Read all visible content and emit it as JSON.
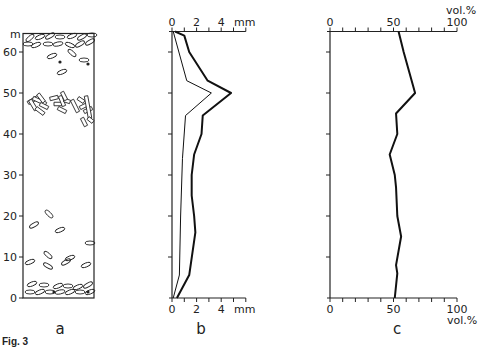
{
  "figure_label": "Fig. 3",
  "depth_axis": {
    "unit": "m",
    "ticks": [
      0,
      10,
      20,
      30,
      40,
      50,
      60
    ],
    "range": [
      0,
      65
    ]
  },
  "chart_data": [
    {
      "panel": "a",
      "type": "diagram",
      "title": "a",
      "description": "Stratigraphic column showing clast shapes with depth",
      "ylabel": "m",
      "yticks": [
        0,
        10,
        20,
        30,
        40,
        50,
        60
      ],
      "ylim": [
        0,
        65
      ],
      "features": [
        {
          "name": "dense elongated clasts",
          "depth_range": [
            56,
            65
          ]
        },
        {
          "name": "scattered clasts",
          "depth_range": [
            52,
            57
          ]
        },
        {
          "name": "angular crystal/fragment cluster",
          "depth_range": [
            43,
            50
          ]
        },
        {
          "name": "single clast",
          "depth_range": [
            19,
            21
          ]
        },
        {
          "name": "scattered clasts",
          "depth_range": [
            5,
            11
          ]
        },
        {
          "name": "dense clasts at base",
          "depth_range": [
            0,
            3
          ]
        }
      ]
    },
    {
      "panel": "b",
      "type": "line",
      "title": "b",
      "xlabel": "mm",
      "ylabel": "m",
      "xticks": [
        0,
        2,
        4
      ],
      "xlim": [
        0,
        6
      ],
      "ylim": [
        0,
        65
      ],
      "series": [
        {
          "name": "thick line",
          "points": [
            [
              0.25,
              65
            ],
            [
              1.0,
              64
            ],
            [
              1.4,
              60
            ],
            [
              2.9,
              53
            ],
            [
              4.8,
              50
            ],
            [
              2.5,
              44.5
            ],
            [
              2.4,
              40
            ],
            [
              1.8,
              35
            ],
            [
              1.6,
              30
            ],
            [
              1.6,
              25
            ],
            [
              1.8,
              20
            ],
            [
              1.9,
              16
            ],
            [
              1.4,
              5.6
            ],
            [
              0.4,
              0
            ]
          ]
        },
        {
          "name": "thin line",
          "points": [
            [
              0.1,
              65
            ],
            [
              1.2,
              53
            ],
            [
              3.2,
              50
            ],
            [
              1.1,
              44.5
            ],
            [
              0.85,
              34
            ],
            [
              0.7,
              20
            ],
            [
              0.6,
              5.6
            ],
            [
              0.1,
              0
            ]
          ]
        }
      ]
    },
    {
      "panel": "c",
      "type": "line",
      "title": "c",
      "xlabel": "vol.%",
      "ylabel": "m",
      "xticks": [
        0,
        50,
        100
      ],
      "xlim": [
        0,
        100
      ],
      "ylim": [
        0,
        65
      ],
      "series": [
        {
          "name": "volume percent",
          "points": [
            [
              54,
              65
            ],
            [
              58,
              60
            ],
            [
              67,
              50
            ],
            [
              52,
              45
            ],
            [
              53,
              40
            ],
            [
              47,
              35
            ],
            [
              51,
              30
            ],
            [
              52,
              27
            ],
            [
              53,
              20
            ],
            [
              56,
              15
            ],
            [
              52,
              8
            ],
            [
              53,
              6
            ],
            [
              51,
              0
            ]
          ]
        }
      ]
    }
  ]
}
